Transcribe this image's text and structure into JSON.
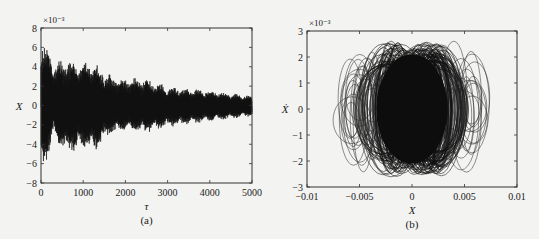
{
  "chart_data": [
    {
      "id": "a",
      "type": "line",
      "title": "",
      "caption": "(a)",
      "xlabel": "τ",
      "ylabel": "X",
      "y_multiplier": "×10⁻³",
      "xlim": [
        0,
        5000
      ],
      "ylim": [
        -8,
        8
      ],
      "xticks": [
        0,
        1000,
        2000,
        3000,
        4000,
        5000
      ],
      "xtick_labels": [
        "0",
        "1000",
        "2000",
        "3000",
        "4000",
        "5000"
      ],
      "yticks": [
        -8,
        -6,
        -4,
        -2,
        0,
        2,
        4,
        6,
        8
      ],
      "ytick_labels": [
        "−8",
        "−6",
        "−4",
        "−2",
        "0",
        "2",
        "4",
        "6",
        "8"
      ],
      "grid": false,
      "legend": null,
      "series": [
        {
          "name": "X(τ)",
          "description": "Decaying oscillation with beat modulation; displacement in units of 1e-3",
          "envelope_tau": [
            0,
            100,
            300,
            600,
            1000,
            1300,
            1600,
            2000,
            2400,
            3000,
            3500,
            4000,
            4500,
            5000
          ],
          "envelope_upper": [
            7.5,
            6.8,
            4.5,
            5.0,
            4.8,
            4.6,
            3.3,
            2.9,
            3.0,
            2.0,
            1.8,
            1.6,
            1.3,
            1.0
          ],
          "envelope_lower": [
            -7.8,
            -6.5,
            -3.5,
            -5.3,
            -4.8,
            -4.8,
            -3.3,
            -2.8,
            -3.0,
            -2.3,
            -2.0,
            -1.7,
            -1.4,
            -1.1
          ]
        }
      ]
    },
    {
      "id": "b",
      "type": "line",
      "title": "",
      "caption": "(b)",
      "xlabel": "X",
      "ylabel": "Ẋ",
      "y_multiplier": "×10⁻³",
      "xlim": [
        -0.01,
        0.01
      ],
      "ylim": [
        -3,
        3
      ],
      "xticks": [
        -0.01,
        -0.005,
        0,
        0.005,
        0.01
      ],
      "xtick_labels": [
        "−0.01",
        "−0.005",
        "0",
        "0.005",
        "0.01"
      ],
      "yticks": [
        -3,
        -2,
        -1,
        0,
        1,
        2,
        3
      ],
      "ytick_labels": [
        "−3",
        "−2",
        "−1",
        "0",
        "1",
        "2",
        "3"
      ],
      "grid": false,
      "legend": null,
      "series": [
        {
          "name": "phase portrait (X, Ẋ)",
          "description": "Dense nested elliptical trajectories",
          "x_extent": [
            -0.0075,
            0.0078
          ],
          "y_extent": [
            -2.65,
            2.6
          ],
          "dense_core_x": [
            -0.0045,
            0.0045
          ]
        }
      ]
    }
  ]
}
